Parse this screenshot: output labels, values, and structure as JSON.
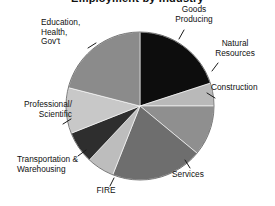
{
  "chart_data": {
    "type": "pie",
    "title": "Employment by Industry",
    "xlabel": "",
    "ylabel": "",
    "legend_position": "none",
    "grid": false,
    "labels_placement": "outside-with-leader-lines",
    "start_angle_deg": -90,
    "direction": "clockwise",
    "categories": [
      "Goods Producing",
      "Natural Resources",
      "Construction",
      "Services",
      "FIRE",
      "Transportation & Warehousing",
      "Professional/ Scientific",
      "Education, Health, Gov't"
    ],
    "values": [
      20,
      5,
      11,
      20,
      6,
      7,
      10,
      21
    ],
    "colors": [
      "#0d0d0d",
      "#b9b9b9",
      "#8f8f8f",
      "#6e6e6e",
      "#bdbdbd",
      "#2e2e2e",
      "#c8c8c8",
      "#8b8b8b"
    ]
  },
  "chart": {
    "title": "Employment by Industry",
    "labels": {
      "goods_producing": "Goods\nProducing",
      "natural_resources": "Natural\nResources",
      "construction": "Construction",
      "services": "Services",
      "fire": "FIRE",
      "transportation": "Transportation &\nWarehousing",
      "professional": "Professional/\nScientific",
      "education": "Education,\nHealth,\nGov't"
    }
  }
}
